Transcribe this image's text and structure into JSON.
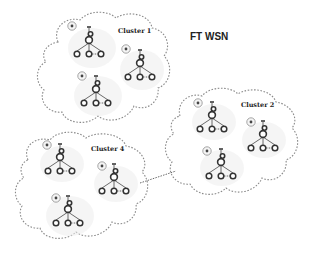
{
  "title": "FT WSN",
  "colors": {
    "background": "#ffffff",
    "cloud_stroke": "#8a8a8a",
    "node_stroke": "#333333",
    "text": "#222222"
  },
  "clusters": [
    {
      "id": "cluster-1",
      "label": "Cluster 1",
      "label_pos": [
        118,
        33
      ],
      "subtrees": [
        {
          "head": [
            89,
            40
          ],
          "badge": [
            72,
            26
          ]
        },
        {
          "head": [
            140,
            63
          ],
          "badge": [
            126,
            49
          ]
        },
        {
          "head": [
            96,
            89
          ],
          "badge": [
            82,
            76
          ]
        }
      ]
    },
    {
      "id": "cluster-2",
      "label": "Cluster 2",
      "label_pos": [
        241,
        107
      ],
      "subtrees": [
        {
          "head": [
            212,
            115
          ],
          "badge": [
            198,
            103
          ]
        },
        {
          "head": [
            263,
            134
          ],
          "badge": [
            251,
            122
          ]
        },
        {
          "head": [
            221,
            162
          ],
          "badge": [
            207,
            151
          ]
        }
      ]
    },
    {
      "id": "cluster-4",
      "label": "Cluster 4",
      "label_pos": [
        91,
        151
      ],
      "subtrees": [
        {
          "head": [
            60,
            157
          ],
          "badge": [
            47,
            145
          ]
        },
        {
          "head": [
            114,
            177
          ],
          "badge": [
            102,
            166
          ]
        },
        {
          "head": [
            68,
            209
          ],
          "badge": [
            56,
            198
          ]
        }
      ]
    }
  ],
  "links": [
    {
      "from": "cluster-4",
      "to": "cluster-2",
      "style": "dashed",
      "points": [
        [
          140,
          183
        ],
        [
          176,
          171
        ]
      ]
    }
  ]
}
